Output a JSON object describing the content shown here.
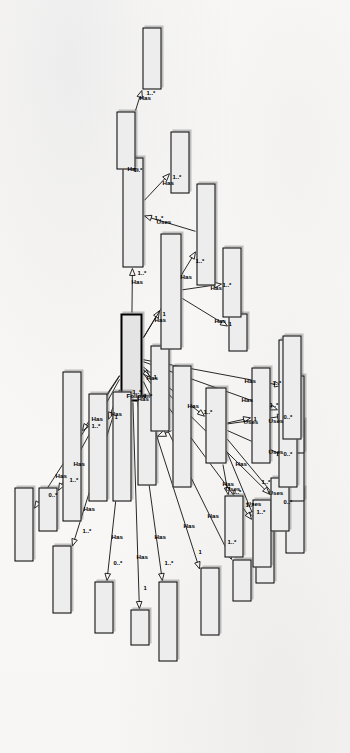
{
  "diagram": {
    "orientation": "rotated-90-ccw",
    "notation": "uml-class-diagram",
    "ghost_text": "scanned page background text",
    "central_class": "Experiment",
    "edge_labels": {
      "has": "Has",
      "follow": "Follow",
      "uses": "Uses"
    },
    "multiplicities": {
      "one": "1",
      "one_many": "1..*",
      "zero_many": "0..*"
    }
  },
  "classes": [
    {
      "id": "experiment",
      "label": "Experiment"
    },
    {
      "id": "mortality_rate",
      "label": "Mortality Rate"
    },
    {
      "id": "result",
      "label": "Result"
    },
    {
      "id": "implications",
      "label": "Implications of Treatment Developed"
    },
    {
      "id": "exp_package",
      "label": "Experimental Package"
    },
    {
      "id": "exp_template",
      "label": "Experimental Template"
    },
    {
      "id": "threat_validity",
      "label": "Threat to Validity"
    },
    {
      "id": "threat_spl",
      "label": "Threat to Validity of SPL"
    },
    {
      "id": "data_analysis",
      "label": "Data Analysis"
    },
    {
      "id": "effect_size",
      "label": "Effect Size"
    },
    {
      "id": "statistical_tool",
      "label": "Statistical Tool"
    },
    {
      "id": "correlation",
      "label": "Correlation"
    },
    {
      "id": "hypothesis_test",
      "label": "Hypothesis Test"
    },
    {
      "id": "normality_test",
      "label": "Normality Test"
    },
    {
      "id": "desc_statistic",
      "label": "Descriptive Statistic"
    },
    {
      "id": "data_collection",
      "label": "Data Collection"
    },
    {
      "id": "pilot_project",
      "label": "Pilot Project"
    },
    {
      "id": "training",
      "label": "Training"
    },
    {
      "id": "aim",
      "label": "Aim"
    },
    {
      "id": "research_topic",
      "label": "Research Topic"
    },
    {
      "id": "size_sample",
      "label": "Size Sample"
    },
    {
      "id": "task",
      "label": "Task"
    },
    {
      "id": "hypothesis",
      "label": "Hypothesis"
    },
    {
      "id": "variable",
      "label": "Variable"
    },
    {
      "id": "participant",
      "label": "Participant/Experimental Object"
    },
    {
      "id": "exp_design",
      "label": "Experimental Design"
    },
    {
      "id": "conduction",
      "label": "Conduction of Experiment"
    },
    {
      "id": "date",
      "label": "Date"
    },
    {
      "id": "environment",
      "label": "Environment"
    },
    {
      "id": "validation",
      "label": "Validation of Material"
    },
    {
      "id": "exp_material",
      "label": "Experimental Material"
    },
    {
      "id": "spl_artifact",
      "label": "SPL Artifact"
    },
    {
      "id": "spl_name",
      "label": "SPL_Name"
    },
    {
      "id": "spl_source",
      "label": "SPL Source"
    }
  ],
  "relationships": [
    {
      "from": "experiment",
      "to": "mortality_rate",
      "label": "Has",
      "mult": "0..*"
    },
    {
      "from": "experiment",
      "to": "result",
      "label": "Has",
      "mult": "1..*"
    },
    {
      "from": "experiment",
      "to": "implications",
      "label": "Has",
      "mult": "1..*"
    },
    {
      "from": "experiment",
      "to": "exp_package",
      "label": "Has",
      "mult": "1"
    },
    {
      "from": "experiment",
      "to": "exp_template",
      "label": "Follow",
      "mult": "1..*"
    },
    {
      "from": "experiment",
      "to": "threat_validity",
      "label": "Has",
      "mult": "1..*"
    },
    {
      "from": "experiment",
      "to": "data_analysis",
      "label": "Has",
      "mult": "1..*"
    },
    {
      "from": "experiment",
      "to": "data_collection",
      "label": "Has",
      "mult": "1"
    },
    {
      "from": "experiment",
      "to": "pilot_project",
      "label": "Has",
      "mult": "1..*"
    },
    {
      "from": "experiment",
      "to": "training",
      "label": "Has",
      "mult": "0..*"
    },
    {
      "from": "experiment",
      "to": "aim",
      "label": "Has",
      "mult": "1"
    },
    {
      "from": "experiment",
      "to": "research_topic",
      "label": "Has",
      "mult": "1..*"
    },
    {
      "from": "experiment",
      "to": "size_sample",
      "label": "Has",
      "mult": "1"
    },
    {
      "from": "experiment",
      "to": "task",
      "label": "Has",
      "mult": "1..*"
    },
    {
      "from": "experiment",
      "to": "hypothesis",
      "label": "Has",
      "mult": "1..*"
    },
    {
      "from": "experiment",
      "to": "variable",
      "label": "Has",
      "mult": "1..*"
    },
    {
      "from": "experiment",
      "to": "participant",
      "label": "Has",
      "mult": "1..*"
    },
    {
      "from": "experiment",
      "to": "exp_design",
      "label": "Has",
      "mult": "1..*"
    },
    {
      "from": "experiment",
      "to": "conduction",
      "label": "Has",
      "mult": "1"
    },
    {
      "from": "experiment",
      "to": "exp_material",
      "label": "Has",
      "mult": "1..*"
    },
    {
      "from": "experiment",
      "to": "validation",
      "label": "Has",
      "mult": "1..*"
    },
    {
      "from": "threat_spl",
      "to": "threat_validity",
      "label": "",
      "mult": "",
      "kind": "generalization"
    },
    {
      "from": "data_analysis",
      "to": "effect_size",
      "label": "Uses",
      "mult": "0..*"
    },
    {
      "from": "data_analysis",
      "to": "statistical_tool",
      "label": "Uses",
      "mult": "1..*"
    },
    {
      "from": "data_analysis",
      "to": "correlation",
      "label": "Uses",
      "mult": "0..*"
    },
    {
      "from": "data_analysis",
      "to": "hypothesis_test",
      "label": "Uses",
      "mult": "0..*"
    },
    {
      "from": "data_analysis",
      "to": "normality_test",
      "label": "Uses",
      "mult": "0..*"
    },
    {
      "from": "data_analysis",
      "to": "desc_statistic",
      "label": "Uses",
      "mult": "1"
    },
    {
      "from": "conduction",
      "to": "date",
      "label": "Has",
      "mult": "1"
    },
    {
      "from": "conduction",
      "to": "environment",
      "label": "Has",
      "mult": "1..*"
    },
    {
      "from": "validation",
      "to": "exp_material",
      "label": "Uses",
      "mult": "1..*"
    },
    {
      "from": "exp_material",
      "to": "spl_artifact",
      "label": "Has",
      "mult": "1..*"
    },
    {
      "from": "exp_material",
      "to": "spl_name",
      "label": "Has",
      "mult": "1..*"
    },
    {
      "from": "spl_name",
      "to": "spl_source",
      "label": "Has",
      "mult": "1..*"
    }
  ]
}
